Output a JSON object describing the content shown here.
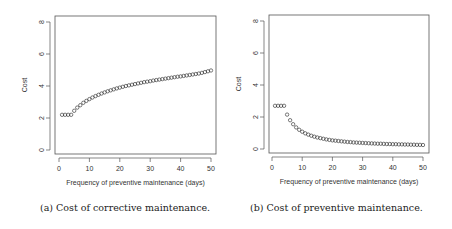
{
  "captions": {
    "a": "(a) Cost of corrective maintenance.",
    "b": "(b) Cost of preventive maintenance."
  },
  "chart_data": [
    {
      "type": "scatter",
      "title": "",
      "caption": "(a) Cost of corrective maintenance.",
      "xlabel": "Frequency of preventive maintenance (days)",
      "ylabel": "Cost",
      "xlim": [
        0,
        50
      ],
      "ylim": [
        0,
        8
      ],
      "xticks": [
        0,
        10,
        20,
        30,
        40,
        50
      ],
      "yticks": [
        0,
        2,
        4,
        6,
        8
      ],
      "grid": false,
      "legend": null,
      "marker": "open-circle",
      "x": [
        1,
        2,
        3,
        4,
        5,
        6,
        7,
        8,
        9,
        10,
        11,
        12,
        13,
        14,
        15,
        16,
        17,
        18,
        19,
        20,
        21,
        22,
        23,
        24,
        25,
        26,
        27,
        28,
        29,
        30,
        31,
        32,
        33,
        34,
        35,
        36,
        37,
        38,
        39,
        40,
        41,
        42,
        43,
        44,
        45,
        46,
        47,
        48,
        49,
        50
      ],
      "y": [
        2.2,
        2.2,
        2.2,
        2.2,
        2.45,
        2.65,
        2.8,
        2.95,
        3.07,
        3.18,
        3.28,
        3.37,
        3.45,
        3.53,
        3.6,
        3.67,
        3.73,
        3.79,
        3.85,
        3.9,
        3.95,
        4.0,
        4.04,
        4.08,
        4.12,
        4.16,
        4.2,
        4.24,
        4.27,
        4.3,
        4.34,
        4.37,
        4.4,
        4.43,
        4.46,
        4.49,
        4.52,
        4.55,
        4.58,
        4.6,
        4.63,
        4.66,
        4.69,
        4.72,
        4.75,
        4.78,
        4.82,
        4.87,
        4.92,
        4.97
      ]
    },
    {
      "type": "scatter",
      "title": "",
      "caption": "(b) Cost of preventive maintenance.",
      "xlabel": "Frequency of preventive maintenance (days)",
      "ylabel": "Cost",
      "xlim": [
        0,
        50
      ],
      "ylim": [
        0,
        8
      ],
      "xticks": [
        0,
        10,
        20,
        30,
        40,
        50
      ],
      "yticks": [
        0,
        2,
        4,
        6,
        8
      ],
      "grid": false,
      "legend": null,
      "marker": "open-circle",
      "x": [
        1,
        2,
        3,
        4,
        5,
        6,
        7,
        8,
        9,
        10,
        11,
        12,
        13,
        14,
        15,
        16,
        17,
        18,
        19,
        20,
        21,
        22,
        23,
        24,
        25,
        26,
        27,
        28,
        29,
        30,
        31,
        32,
        33,
        34,
        35,
        36,
        37,
        38,
        39,
        40,
        41,
        42,
        43,
        44,
        45,
        46,
        47,
        48,
        49,
        50
      ],
      "y": [
        2.7,
        2.7,
        2.7,
        2.7,
        2.15,
        1.8,
        1.55,
        1.35,
        1.2,
        1.08,
        0.98,
        0.9,
        0.83,
        0.77,
        0.72,
        0.68,
        0.64,
        0.6,
        0.57,
        0.54,
        0.52,
        0.5,
        0.48,
        0.46,
        0.44,
        0.43,
        0.41,
        0.4,
        0.39,
        0.38,
        0.37,
        0.36,
        0.35,
        0.34,
        0.33,
        0.33,
        0.32,
        0.31,
        0.31,
        0.3,
        0.3,
        0.29,
        0.29,
        0.28,
        0.28,
        0.27,
        0.27,
        0.26,
        0.26,
        0.25
      ]
    }
  ]
}
